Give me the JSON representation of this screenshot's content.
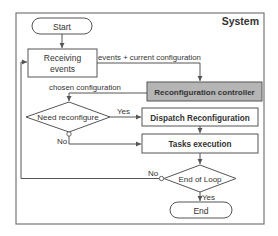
{
  "diagram": {
    "container_label": "System",
    "colors": {
      "stroke": "#555555",
      "controller_fill": "#b5b5b5",
      "box_fill": "#ffffff",
      "text": "#333333"
    },
    "nodes": {
      "start": "Start",
      "receiving_events_line1": "Receiving",
      "receiving_events_line2": "events",
      "reconfiguration_controller": "Reconfiguration controller",
      "need_reconfigure": "Need reconfigure",
      "dispatch_reconfiguration": "Dispatch Reconfiguration",
      "tasks_execution": "Tasks execution",
      "end_of_loop": "End of Loop",
      "end": "End"
    },
    "edge_labels": {
      "events_current_config": "events + current configuration",
      "chosen_configuration": "chosen configuration",
      "need_yes": "Yes",
      "need_no": "No",
      "loop_no": "No",
      "loop_yes": "Yes"
    }
  }
}
